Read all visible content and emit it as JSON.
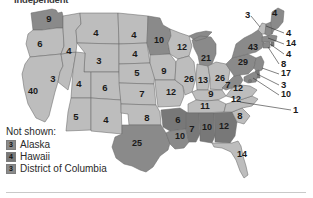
{
  "figure": {
    "clipped_title": "Independent",
    "background_color": "#ffffff"
  },
  "palette": {
    "light": "#bdbdbd",
    "medium": "#9e9e9e",
    "dark": "#8a8a8a",
    "darker": "#787878",
    "outline": "#6b6b6b",
    "text": "#1a1a1a",
    "rule": "#c9c9c9"
  },
  "chart_data": {
    "type": "map",
    "title": "Independent",
    "xlabel": "",
    "ylabel": "",
    "grid": false,
    "legend_position": "bottom-left",
    "categories": [
      "Washington",
      "Oregon",
      "California",
      "Nevada",
      "Idaho",
      "Montana",
      "Wyoming",
      "Utah",
      "Arizona",
      "Colorado",
      "New Mexico",
      "North Dakota",
      "South Dakota",
      "Nebraska",
      "Kansas",
      "Oklahoma",
      "Texas",
      "Minnesota",
      "Iowa",
      "Missouri",
      "Arkansas",
      "Louisiana",
      "Wisconsin",
      "Illinois",
      "Michigan",
      "Indiana",
      "Ohio",
      "Kentucky",
      "Tennessee",
      "Mississippi",
      "Alabama",
      "Georgia",
      "Florida",
      "South Carolina",
      "North Carolina",
      "Virginia",
      "West Virginia",
      "Maryland",
      "Delaware",
      "Pennsylvania",
      "New Jersey",
      "New York",
      "Connecticut",
      "Rhode Island",
      "Massachusetts",
      "Vermont",
      "New Hampshire",
      "Maine",
      "Alaska",
      "Hawaii",
      "District of Columbia"
    ],
    "values": [
      9,
      6,
      40,
      3,
      4,
      4,
      3,
      4,
      5,
      6,
      4,
      4,
      4,
      5,
      7,
      8,
      25,
      10,
      9,
      12,
      6,
      10,
      12,
      26,
      21,
      13,
      26,
      9,
      11,
      7,
      10,
      12,
      14,
      8,
      12,
      12,
      7,
      10,
      3,
      29,
      17,
      43,
      8,
      4,
      14,
      3,
      4,
      4,
      3,
      4,
      3
    ]
  },
  "map": {
    "states": [
      {
        "id": "wa",
        "label": "9",
        "shade": "dark",
        "lx": 49,
        "ly": 19
      },
      {
        "id": "or",
        "label": "6",
        "shade": "light",
        "lx": 40,
        "ly": 44
      },
      {
        "id": "ca",
        "label": "40",
        "shade": "light",
        "lx": 33,
        "ly": 92
      },
      {
        "id": "nv",
        "label": "3",
        "shade": "light",
        "lx": 53,
        "ly": 79
      },
      {
        "id": "id",
        "label": "4",
        "shade": "light",
        "lx": 69,
        "ly": 51
      },
      {
        "id": "mt",
        "label": "4",
        "shade": "light",
        "lx": 96,
        "ly": 33
      },
      {
        "id": "wy",
        "label": "3",
        "shade": "light",
        "lx": 99,
        "ly": 61
      },
      {
        "id": "ut",
        "label": "4",
        "shade": "light",
        "lx": 79,
        "ly": 84
      },
      {
        "id": "az",
        "label": "5",
        "shade": "light",
        "lx": 76,
        "ly": 117
      },
      {
        "id": "co",
        "label": "6",
        "shade": "light",
        "lx": 105,
        "ly": 88
      },
      {
        "id": "nm",
        "label": "4",
        "shade": "light",
        "lx": 106,
        "ly": 120
      },
      {
        "id": "nd",
        "label": "4",
        "shade": "light",
        "lx": 134,
        "ly": 35
      },
      {
        "id": "sd",
        "label": "4",
        "shade": "light",
        "lx": 135,
        "ly": 54
      },
      {
        "id": "ne",
        "label": "5",
        "shade": "light",
        "lx": 137,
        "ly": 73
      },
      {
        "id": "ks",
        "label": "7",
        "shade": "light",
        "lx": 142,
        "ly": 94
      },
      {
        "id": "ok",
        "label": "8",
        "shade": "light",
        "lx": 147,
        "ly": 118
      },
      {
        "id": "tx",
        "label": "25",
        "shade": "dark",
        "lx": 137,
        "ly": 144
      },
      {
        "id": "mn",
        "label": "10",
        "shade": "dark",
        "lx": 159,
        "ly": 41
      },
      {
        "id": "ia",
        "label": "9",
        "shade": "light",
        "lx": 164,
        "ly": 71
      },
      {
        "id": "mo",
        "label": "12",
        "shade": "light",
        "lx": 171,
        "ly": 93
      },
      {
        "id": "ar",
        "label": "6",
        "shade": "darker",
        "lx": 178,
        "ly": 120
      },
      {
        "id": "la",
        "label": "10",
        "shade": "dark",
        "lx": 180,
        "ly": 137
      },
      {
        "id": "wi",
        "label": "12",
        "shade": "light",
        "lx": 182,
        "ly": 48
      },
      {
        "id": "il",
        "label": "26",
        "shade": "light",
        "lx": 189,
        "ly": 80
      },
      {
        "id": "mi",
        "label": "21",
        "shade": "dark",
        "lx": 206,
        "ly": 59
      },
      {
        "id": "in",
        "label": "13",
        "shade": "light",
        "lx": 203,
        "ly": 81
      },
      {
        "id": "oh",
        "label": "26",
        "shade": "light",
        "lx": 220,
        "ly": 79
      },
      {
        "id": "ky",
        "label": "9",
        "shade": "light",
        "lx": 211,
        "ly": 94
      },
      {
        "id": "tn",
        "label": "11",
        "shade": "light",
        "lx": 205,
        "ly": 107
      },
      {
        "id": "ms",
        "label": "7",
        "shade": "darker",
        "lx": 192,
        "ly": 129
      },
      {
        "id": "al",
        "label": "10",
        "shade": "darker",
        "lx": 207,
        "ly": 128
      },
      {
        "id": "ga",
        "label": "12",
        "shade": "darker",
        "lx": 224,
        "ly": 127
      },
      {
        "id": "fl",
        "label": "14",
        "shade": "light",
        "lx": 242,
        "ly": 155
      },
      {
        "id": "sc",
        "label": "8",
        "shade": "light",
        "lx": 240,
        "ly": 116
      },
      {
        "id": "nc",
        "label": "12",
        "shade": "light",
        "lx": 236,
        "ly": 100
      },
      {
        "id": "va",
        "label": "12",
        "shade": "light",
        "lx": 238,
        "ly": 89
      },
      {
        "id": "wv",
        "label": "7",
        "shade": "dark",
        "lx": 228,
        "ly": 85
      },
      {
        "id": "pa",
        "label": "29",
        "shade": "dark",
        "lx": 243,
        "ly": 63
      },
      {
        "id": "ny",
        "label": "43",
        "shade": "dark",
        "lx": 253,
        "ly": 48
      }
    ],
    "callouts": [
      {
        "id": "vt",
        "label": "3",
        "tx": 245,
        "ty": 15,
        "x1": 251,
        "y1": 16,
        "x2": 260,
        "y2": 27
      },
      {
        "id": "me",
        "label": "4",
        "tx": 272,
        "ty": 13,
        "x1": 0,
        "y1": 0,
        "x2": 0,
        "y2": 0
      },
      {
        "id": "nh",
        "label": "4",
        "tx": 286,
        "ty": 33,
        "x1": 284,
        "y1": 33,
        "x2": 266,
        "y2": 26
      },
      {
        "id": "ma",
        "label": "14",
        "tx": 286,
        "ty": 44,
        "x1": 284,
        "y1": 44,
        "x2": 268,
        "y2": 38
      },
      {
        "id": "ri",
        "label": "4",
        "tx": 286,
        "ty": 54,
        "x1": 284,
        "y1": 54,
        "x2": 270,
        "y2": 44
      },
      {
        "id": "ct",
        "label": "8",
        "tx": 281,
        "ty": 64,
        "x1": 279,
        "y1": 64,
        "x2": 268,
        "y2": 47
      },
      {
        "id": "nj",
        "label": "17",
        "tx": 281,
        "ty": 74,
        "x1": 279,
        "y1": 74,
        "x2": 262,
        "y2": 68
      },
      {
        "id": "de",
        "label": "3",
        "tx": 281,
        "ty": 85,
        "x1": 279,
        "y1": 85,
        "x2": 257,
        "y2": 74
      },
      {
        "id": "md",
        "label": "10",
        "tx": 281,
        "ty": 95,
        "x1": 279,
        "y1": 95,
        "x2": 253,
        "y2": 78
      },
      {
        "id": "dc",
        "label": "1",
        "tx": 293,
        "ty": 110,
        "x1": 291,
        "y1": 110,
        "x2": 240,
        "y2": 102
      }
    ]
  },
  "legend": {
    "title": "Not shown:",
    "items": [
      {
        "value": "3",
        "name": "Alaska",
        "shade": "dark"
      },
      {
        "value": "4",
        "name": "Hawaii",
        "shade": "darker"
      },
      {
        "value": "3",
        "name": "District of Columbia",
        "shade": "dark"
      }
    ]
  }
}
